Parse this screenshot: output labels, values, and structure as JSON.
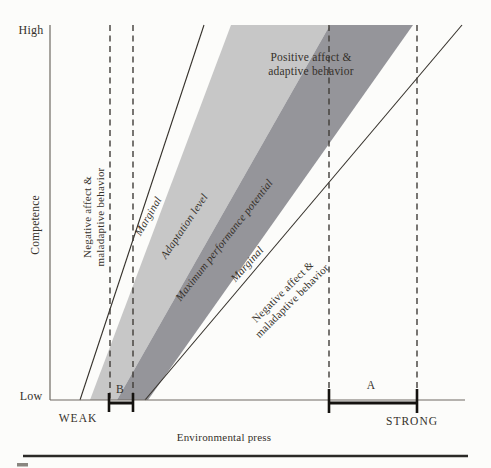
{
  "figure": {
    "y_axis": {
      "title": "Competence",
      "top_label": "High",
      "bottom_label": "Low"
    },
    "x_axis": {
      "title": "Environmental press",
      "left_label": "WEAK",
      "right_label": "STRONG"
    },
    "zones": {
      "negative_left": {
        "line1": "Negative affect &",
        "line2": "maladaptive behavior"
      },
      "marginal_left": "Marginal",
      "adaptation": "Adaptation level",
      "max_performance": "Maximum performance potential",
      "marginal_right": "Marginal",
      "negative_right": {
        "line1": "Negative affect &",
        "line2": "maladaptive behavior"
      },
      "positive": {
        "line1": "Positive affect &",
        "line2": "adaptive behavior"
      }
    },
    "markers": {
      "a": "A",
      "b": "B"
    },
    "colors": {
      "light_band": "#c7c7c7",
      "dark_band": "#95959a",
      "line": "#35312b",
      "dash": "#413d38",
      "axis": "#6e6962",
      "rule": "#2b2a27"
    }
  }
}
